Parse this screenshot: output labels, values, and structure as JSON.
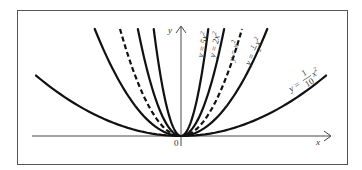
{
  "diagram": {
    "axes": {
      "x_label": "x",
      "y_label": "y",
      "origin_label": "0"
    },
    "curves": [
      {
        "id": "a5",
        "coef": 5,
        "style": "solid",
        "label_y": "y",
        "label_eq": "=",
        "label_coef": "5",
        "label_var": "x",
        "label_exp": "2"
      },
      {
        "id": "a2",
        "coef": 2,
        "style": "solid",
        "label_y": "y",
        "label_eq": "=",
        "label_coef": "2",
        "label_var": "x",
        "label_exp": "2"
      },
      {
        "id": "a1",
        "coef": 1,
        "style": "dashed",
        "label_y": "y",
        "label_eq": "=",
        "label_coef": "",
        "label_var": "x",
        "label_exp": "2"
      },
      {
        "id": "a05",
        "coef": 0.5,
        "style": "solid",
        "label_y": "y",
        "label_eq": "=",
        "label_num": "1",
        "label_den": "2",
        "label_var": "x",
        "label_exp": "2"
      },
      {
        "id": "a01",
        "coef": 0.1,
        "style": "solid",
        "label_y": "y",
        "label_eq": "=",
        "label_num": "1",
        "label_den": "10",
        "label_var": "x",
        "label_exp": "2"
      }
    ]
  },
  "chart_data": {
    "type": "line",
    "title": "",
    "xlabel": "x",
    "ylabel": "y",
    "grid": false,
    "legend": "inline labels along curves",
    "series": [
      {
        "name": "y = 5x^2",
        "a": 5,
        "style": "solid"
      },
      {
        "name": "y = 2x^2",
        "a": 2,
        "style": "solid"
      },
      {
        "name": "y = x^2",
        "a": 1,
        "style": "dashed"
      },
      {
        "name": "y = 1/2 x^2",
        "a": 0.5,
        "style": "solid"
      },
      {
        "name": "y = 1/10 x^2",
        "a": 0.1,
        "style": "solid"
      }
    ]
  }
}
